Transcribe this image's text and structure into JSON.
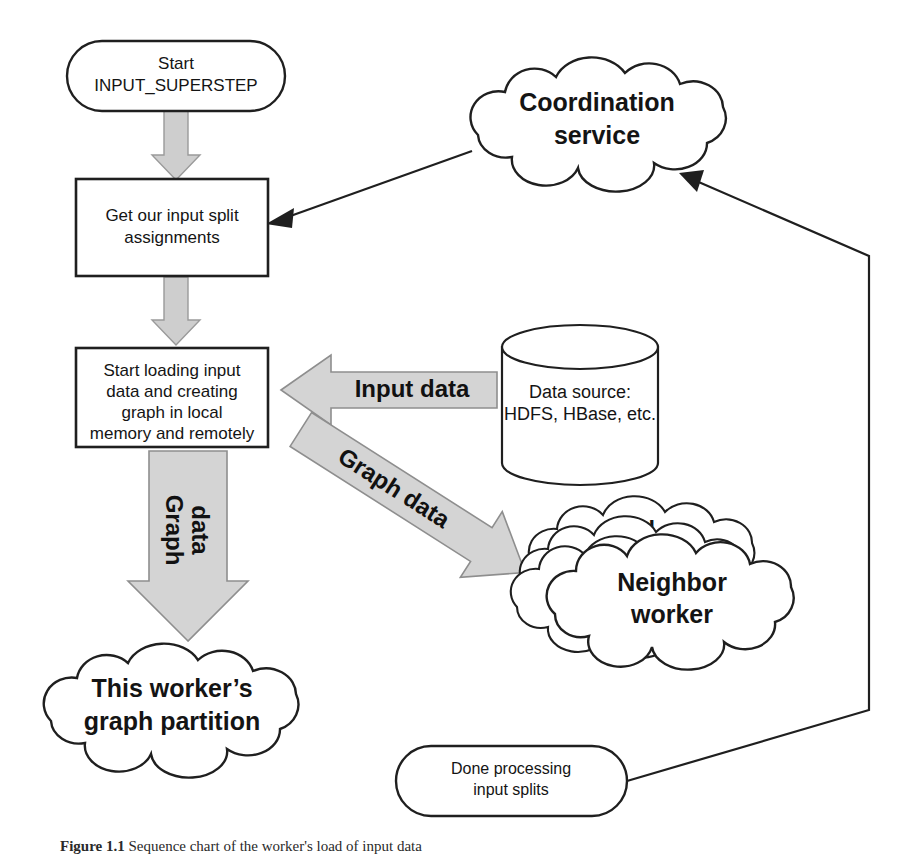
{
  "figure": {
    "caption_label": "Figure 1.1",
    "caption_text": "Sequence chart of the worker's load of input data"
  },
  "nodes": {
    "start": {
      "name": "start-terminator",
      "line1": "Start",
      "line2": "INPUT_SUPERSTEP"
    },
    "get_splits": {
      "name": "get-input-split-assignments",
      "line1": "Get our input split",
      "line2": "assignments"
    },
    "load_data": {
      "name": "start-loading-input-data",
      "line1": "Start loading input",
      "line2": "data and creating",
      "line3": "graph in local",
      "line4": "memory and remotely"
    },
    "data_source": {
      "name": "data-source-cylinder",
      "line1": "Data source:",
      "line2": "HDFS, HBase, etc."
    },
    "coordination": {
      "name": "coordination-service-cloud",
      "line1": "Coordination",
      "line2": "service"
    },
    "neighbor": {
      "name": "neighbor-worker-cloud",
      "line1": "Neighbor",
      "line2": "worker",
      "stack_glyph": "N",
      "stack_count": 4
    },
    "partition": {
      "name": "this-workers-graph-partition-cloud",
      "line1": "This worker’s",
      "line2": "graph partition"
    },
    "done": {
      "name": "done-processing-terminator",
      "line1": "Done processing",
      "line2": "input splits"
    }
  },
  "arrows": {
    "input_data": {
      "name": "input-data-block-arrow",
      "label": "Input data",
      "direction": "left"
    },
    "graph_data_diagonal": {
      "name": "graph-data-diagonal-block-arrow",
      "label": "Graph data",
      "direction": "down-right"
    },
    "graph_data_vertical": {
      "name": "graph-data-vertical-block-arrow",
      "label_line1": "Graph",
      "label_line2": "data",
      "direction": "down"
    },
    "start_to_splits": {
      "name": "flow-arrow-start-to-splits",
      "direction": "down"
    },
    "splits_to_load": {
      "name": "flow-arrow-splits-to-load",
      "direction": "down"
    },
    "coordination_to_splits": {
      "name": "connector-coordination-to-splits",
      "direction": "down-left"
    },
    "done_to_coordination": {
      "name": "connector-done-to-coordination",
      "direction": "up-left"
    }
  },
  "colors": {
    "outline": "#1f1f1f",
    "block_arrow_fill": "#d4d4d4",
    "block_arrow_stroke": "#8e8e8e",
    "background": "#ffffff"
  }
}
